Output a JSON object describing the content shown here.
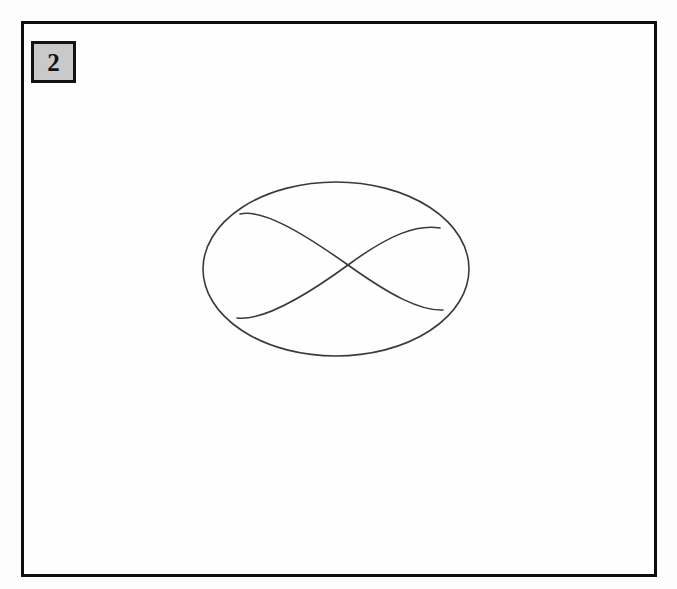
{
  "page": {
    "background_color": "#fdfdfd",
    "width": 677,
    "height": 589
  },
  "frame": {
    "name": "figure-frame",
    "border_color": "#0d0d0d",
    "border_width": 3,
    "fill_color": "#fefefe",
    "left": 21,
    "top": 21,
    "width": 636,
    "height": 556
  },
  "figure_label": {
    "number": "2",
    "box_fill_color": "#c9c9c9",
    "box_border_color": "#121212",
    "text_color": "#111111",
    "left": 31,
    "top": 41,
    "width": 45,
    "height": 42
  },
  "chart_data": {
    "type": "diagram",
    "title": "",
    "subtitle": "",
    "stroke_color": "#3a3a3a",
    "stroke_width": 1.6,
    "ellipse": {
      "name": "outer-ellipse",
      "center_x": 336,
      "center_y": 269,
      "radius_x": 133,
      "radius_y": 87,
      "bounds": {
        "left": 203,
        "top": 182,
        "right": 469,
        "bottom": 356
      }
    },
    "crossing_point": {
      "x": 348,
      "y": 265
    },
    "tangent_points": [
      {
        "name": "upper-left",
        "x": 240,
        "y": 214
      },
      {
        "name": "upper-right",
        "x": 440,
        "y": 228
      },
      {
        "name": "lower-left",
        "x": 237,
        "y": 318
      },
      {
        "name": "lower-right",
        "x": 443,
        "y": 310
      }
    ],
    "arcs": [
      {
        "name": "arc-upper-left-to-lower-right",
        "start": {
          "x": 240,
          "y": 214
        },
        "end": {
          "x": 443,
          "y": 310
        },
        "through": {
          "x": 348,
          "y": 265
        },
        "path": "M 240 214 C 262 209, 300 231, 348 265 C 390 295, 420 311, 443 310"
      },
      {
        "name": "arc-lower-left-to-upper-right",
        "start": {
          "x": 237,
          "y": 318
        },
        "end": {
          "x": 440,
          "y": 228
        },
        "through": {
          "x": 348,
          "y": 265
        },
        "path": "M 237 318 C 260 321, 300 300, 348 265 C 390 234, 418 224, 440 228"
      }
    ],
    "grid": false,
    "legend": null,
    "axes": null
  }
}
